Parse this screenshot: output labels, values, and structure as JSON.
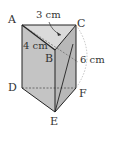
{
  "diagram": {
    "type": "triangular-prism",
    "vertices": {
      "A": "A",
      "B": "B",
      "C": "C",
      "D": "D",
      "E": "E",
      "F": "F"
    },
    "measurements": {
      "AC": "3 cm",
      "AB": "4 cm",
      "CF": "6 cm"
    },
    "colors": {
      "face_fill": "#c8c8c8",
      "top_fill": "#d8d8d8",
      "edge": "#222222",
      "dashed": "#555555",
      "arc": "#aaaaaa"
    }
  }
}
